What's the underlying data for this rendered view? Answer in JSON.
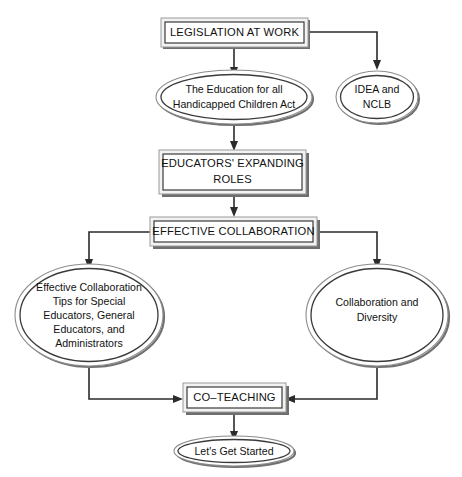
{
  "diagram": {
    "background_color": "#ffffff",
    "line_color": "#2b2b2b",
    "text_color": "#111111",
    "box_fill": "#ffffff",
    "box_frame_fill": "#f2f2f2",
    "nodes": {
      "legislation": {
        "shape": "box",
        "label": "LEGISLATION AT WORK"
      },
      "education_act": {
        "shape": "ellipse",
        "line1": "The Education for all",
        "line2": "Handicapped Children Act"
      },
      "idea_nclb": {
        "shape": "ellipse",
        "line1": "IDEA and",
        "line2": "NCLB"
      },
      "educators_roles": {
        "shape": "box",
        "line1": "EDUCATORS' EXPANDING",
        "line2": "ROLES"
      },
      "effective_collaboration": {
        "shape": "box",
        "label": "EFFECTIVE COLLABORATION"
      },
      "tips": {
        "shape": "ellipse",
        "line1": "Effective Collaboration",
        "line2": "Tips for Special",
        "line3": "Educators, General",
        "line4": "Educators, and",
        "line5": "Administrators"
      },
      "diversity": {
        "shape": "ellipse",
        "line1": "Collaboration and",
        "line2": "Diversity"
      },
      "co_teaching": {
        "shape": "box",
        "label": "CO–TEACHING"
      },
      "lets_get_started": {
        "shape": "ellipse",
        "label": "Let's Get Started"
      }
    },
    "edges": [
      {
        "from": "legislation",
        "to": "education_act",
        "style": "straight-down-arrow"
      },
      {
        "from": "legislation",
        "to": "idea_nclb",
        "style": "right-then-down-arrow"
      },
      {
        "from": "education_act",
        "to": "educators_roles",
        "style": "straight-down-arrow"
      },
      {
        "from": "educators_roles",
        "to": "effective_collaboration",
        "style": "straight-down-arrow"
      },
      {
        "from": "effective_collaboration",
        "to": "tips",
        "style": "left-then-down-arrow"
      },
      {
        "from": "effective_collaboration",
        "to": "diversity",
        "style": "right-then-down-arrow"
      },
      {
        "from": "tips",
        "to": "co_teaching",
        "style": "down-then-right-arrow"
      },
      {
        "from": "diversity",
        "to": "co_teaching",
        "style": "down-then-left-arrow"
      },
      {
        "from": "co_teaching",
        "to": "lets_get_started",
        "style": "straight-down-arrow"
      }
    ]
  }
}
